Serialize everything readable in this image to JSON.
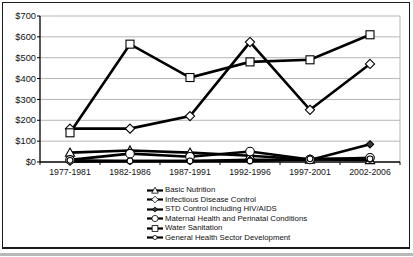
{
  "chart_data": {
    "type": "line",
    "title": "",
    "xlabel": "",
    "ylabel": "",
    "categories": [
      "1977-1981",
      "1982-1986",
      "1987-1991",
      "1992-1996",
      "1997-2001",
      "2002-2006"
    ],
    "series": [
      {
        "name": "Basic Nutrition",
        "marker": "triangle",
        "values": [
          45,
          55,
          45,
          30,
          12,
          10
        ]
      },
      {
        "name": "Infectious Disease Control",
        "marker": "diamond-open",
        "values": [
          160,
          160,
          220,
          575,
          250,
          470
        ]
      },
      {
        "name": "STD Control Including HIV/AIDS",
        "marker": "diamond-filled",
        "values": [
          2,
          5,
          5,
          10,
          10,
          85
        ]
      },
      {
        "name": "Maternal Health and Perinatal Conditions",
        "marker": "circle-open",
        "values": [
          10,
          40,
          25,
          50,
          12,
          20
        ]
      },
      {
        "name": "Water Sanitation",
        "marker": "square-open",
        "values": [
          140,
          565,
          405,
          480,
          490,
          610
        ]
      },
      {
        "name": "General Health Sector Development",
        "marker": "circle-small",
        "values": [
          8,
          5,
          5,
          5,
          15,
          15
        ]
      }
    ],
    "ylim": [
      0,
      700
    ],
    "ytick_step": 100,
    "ytick_labels": [
      "$0",
      "$100",
      "$200",
      "$300",
      "$400",
      "$500",
      "$600",
      "$700"
    ],
    "grid": true,
    "legend_position": "bottom",
    "line_color": "#000000",
    "marker_fill": "#ffffff",
    "filled_marker_color": "#3a3a3a",
    "gridline_color": "#b5b5b5",
    "axis_color": "#000000"
  }
}
